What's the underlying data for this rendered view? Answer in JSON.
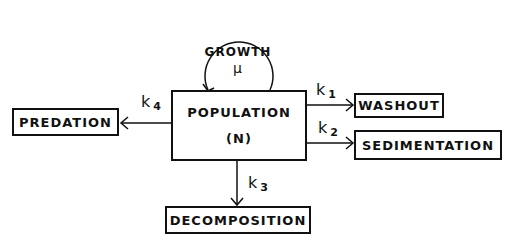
{
  "diagram": {
    "center": {
      "label": "POPULATION",
      "symbol": "(N)"
    },
    "self_loop": {
      "label": "GROWTH",
      "symbol": "μ"
    },
    "flows": [
      {
        "target": "WASHOUT",
        "rate": "k",
        "subscript": "1"
      },
      {
        "target": "SEDIMENTATION",
        "rate": "k",
        "subscript": "2"
      },
      {
        "target": "DECOMPOSITION",
        "rate": "k",
        "subscript": "3"
      },
      {
        "target": "PREDATION",
        "rate": "k",
        "subscript": "4"
      }
    ]
  }
}
